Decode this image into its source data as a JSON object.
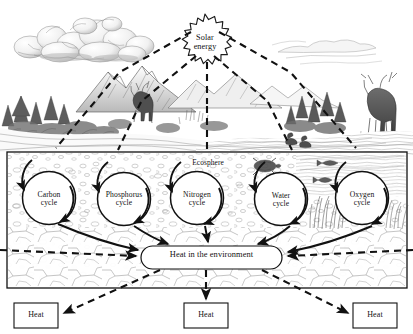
{
  "diagram": {
    "sun": {
      "label": "Solar\nenergy",
      "name": "solar-energy"
    },
    "ecosphere": {
      "label": "Ecosphere"
    },
    "cycles": [
      {
        "label": "Carbon\ncycle",
        "name": "carbon-cycle",
        "cx": 49,
        "cy": 198,
        "r": 26.5
      },
      {
        "label": "Phosphorus\ncycle",
        "name": "phosphorus-cycle",
        "cx": 124,
        "cy": 199,
        "r": 26.5
      },
      {
        "label": "Nitrogen\ncycle",
        "name": "nitrogen-cycle",
        "cx": 197,
        "cy": 198,
        "r": 26.5
      },
      {
        "label": "Water\ncycle",
        "name": "water-cycle",
        "cx": 281,
        "cy": 199,
        "r": 26.5
      },
      {
        "label": "Oxygen\ncycle",
        "name": "oxygen-cycle",
        "cx": 362,
        "cy": 198,
        "r": 26.5
      }
    ],
    "heat_sink": {
      "label": "Heat in the environment"
    },
    "heat_outputs": [
      {
        "label": "Heat",
        "name": "heat-output-left"
      },
      {
        "label": "Heat",
        "name": "heat-output-center"
      },
      {
        "label": "Heat",
        "name": "heat-output-right"
      }
    ],
    "colors": {
      "ink": "#111111",
      "line": "#1a1a1a",
      "sketch_light": "#9a9a9a",
      "sketch_mid": "#6e6e6e",
      "sketch_dark": "#3a3a3a",
      "background": "#ffffff"
    }
  }
}
